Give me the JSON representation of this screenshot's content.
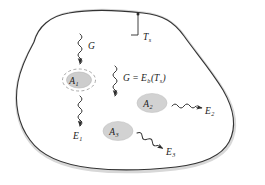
{
  "figure": {
    "domain_type": "diagram",
    "background_color": "#ffffff",
    "enclosure": {
      "name": "enclosure-boundary",
      "line_color": "#2b2b2b",
      "shadow_color": "#d5d5d5",
      "fill_color": "#ffffff",
      "surface_temperature_label": "T",
      "surface_temperature_subscript": "s"
    },
    "surfaces": [
      {
        "id": "A1",
        "label": "A",
        "subscript": "1",
        "fill_color": "#cfcfcf",
        "dashed_outline": true,
        "cx": 79,
        "cy": 80,
        "rx": 13,
        "ry": 8.5
      },
      {
        "id": "A2",
        "label": "A",
        "subscript": "2",
        "fill_color": "#d2d2d2",
        "dashed_outline": false,
        "cx": 152,
        "cy": 102,
        "rx": 15,
        "ry": 9
      },
      {
        "id": "A3",
        "label": "A",
        "subscript": "3",
        "fill_color": "#d2d2d2",
        "dashed_outline": false,
        "cx": 118,
        "cy": 130,
        "rx": 15,
        "ry": 9
      }
    ],
    "irradiation_arrows": [
      {
        "id": "G-left",
        "label": "G",
        "subscript": "",
        "equation": "G",
        "direction": "down",
        "x": 80,
        "y_start": 35,
        "y_end": 62,
        "label_x": 88,
        "label_y": 48
      },
      {
        "id": "G-center",
        "label": "G",
        "subscript": "",
        "equation": "G = E",
        "equation_sub": "b",
        "equation_tail": "(T",
        "equation_tail_sub": "s",
        "equation_close": ")",
        "direction": "down",
        "x": 115,
        "y_start": 67,
        "y_end": 94,
        "label_x": 124,
        "label_y": 80
      }
    ],
    "emission_arrows": [
      {
        "id": "E1",
        "label": "E",
        "subscript": "1",
        "direction": "down",
        "x": 80,
        "y_start": 97,
        "y_end": 124,
        "label_x": 76,
        "label_y": 138
      },
      {
        "id": "E2",
        "label": "E",
        "subscript": "2",
        "direction": "right",
        "x_start": 172,
        "y_start": 106,
        "x_end": 201,
        "y_end": 108,
        "label_x": 205,
        "label_y": 114
      },
      {
        "id": "E3",
        "label": "E",
        "subscript": "3",
        "direction": "down-right",
        "x_start": 137,
        "y_start": 133,
        "x_end": 162,
        "y_end": 148,
        "label_x": 166,
        "label_y": 154
      }
    ],
    "leader": {
      "name": "temperature-leader-line",
      "x": 138,
      "y_top": 16,
      "y_bottom": 35,
      "tick_x_start": 131,
      "label_x": 143,
      "label_y": 40
    }
  }
}
